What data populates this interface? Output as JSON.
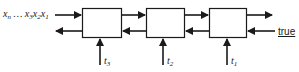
{
  "diagram": {
    "type": "block-chain",
    "input_sequence": {
      "x_n": "x",
      "x_n_sub": "n",
      "ellipsis": " … ",
      "x_3": "x",
      "x_3_sub": "3",
      "x_2": "x",
      "x_2_sub": "2",
      "x_1": "x",
      "x_1_sub": "1"
    },
    "boxes": [
      {
        "id": "box-1",
        "input_label": "t",
        "input_sub": "3"
      },
      {
        "id": "box-2",
        "input_label": "t",
        "input_sub": "2"
      },
      {
        "id": "box-3",
        "input_label": "t",
        "input_sub": "1"
      }
    ],
    "right_input_label": "true",
    "colors": {
      "stroke": "#1a1a1a",
      "background": "#ffffff"
    }
  }
}
